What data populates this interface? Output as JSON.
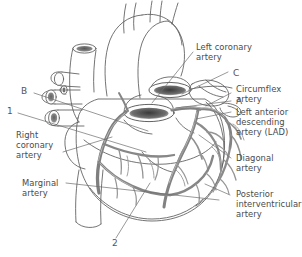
{
  "figure": {
    "type": "anatomical-line-diagram",
    "background_color": "#ffffff",
    "line_color": "#5a5a5a",
    "vessel_color": "#8d8d8d",
    "text_color": "#4a4a4a"
  },
  "labels": {
    "left_coronary_artery": "Left coronary\nartery",
    "marker_c": "C",
    "circumflex_artery": "Circumflex\nartery",
    "marker_a": "A",
    "lad": "Left anterior\ndescending\nartery (LAD)",
    "diagonal_artery": "Diagonal\nartery",
    "posterior_interventricular_artery": "Posterior\ninterventricular\nartery",
    "marker_b": "B",
    "marker_1": "1",
    "right_coronary_artery": "Right\ncoronary\nartery",
    "marginal_artery": "Marginal\nartery",
    "marker_2": "2"
  }
}
